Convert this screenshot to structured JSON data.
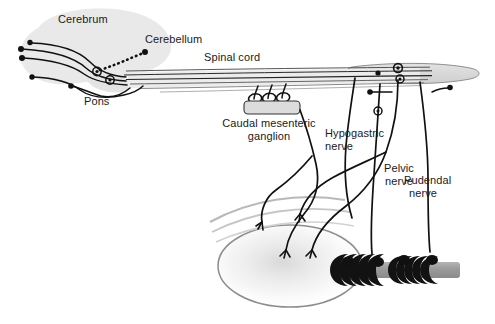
{
  "figure": {
    "background_color": "#ffffff",
    "width": 495,
    "height": 324
  },
  "colors": {
    "brain_fill": "#e8e8e8",
    "spinal_fill": "#d8d8d8",
    "ganglion_fill": "#d9d9d9",
    "nerve_stroke": "#000000",
    "outline_stroke": "#6e6e6e",
    "bladder_stroke": "#8a8a8a",
    "urethra_fill": "#9a9a9a",
    "sphincter_fill": "#111111",
    "text_color": "#1a1a1a"
  },
  "labels": {
    "cerebrum": "Cerebrum",
    "cerebellum": "Cerebellum",
    "pons": "Pons",
    "spinal_cord": "Spinal cord",
    "caudal_mesenteric_ganglion_line1": "Caudal mesenteric",
    "caudal_mesenteric_ganglion_line2": "ganglion",
    "hypogastric_line1": "Hypogastric",
    "hypogastric_line2": "nerve",
    "pelvic_line1": "Pelvic",
    "pelvic_line2": "nerve",
    "pudendal_line1": "Pudendal",
    "pudendal_line2": "nerve"
  },
  "structures": [
    {
      "name": "cerebrum",
      "type": "brain-region",
      "label": "Cerebrum"
    },
    {
      "name": "cerebellum",
      "type": "brain-region",
      "label": "Cerebellum"
    },
    {
      "name": "pons",
      "type": "brainstem-region",
      "label": "Pons"
    },
    {
      "name": "spinal-cord",
      "type": "cord",
      "label": "Spinal cord"
    },
    {
      "name": "caudal-mesenteric-ganglion",
      "type": "ganglion",
      "label": "Caudal mesenteric ganglion"
    },
    {
      "name": "urinary-bladder",
      "type": "organ",
      "label": ""
    },
    {
      "name": "urethra",
      "type": "organ",
      "label": ""
    },
    {
      "name": "urethral-sphincter",
      "type": "muscle",
      "label": ""
    }
  ],
  "nerves": [
    {
      "name": "hypogastric-nerve",
      "label": "Hypogastric nerve",
      "type": "sympathetic"
    },
    {
      "name": "pelvic-nerve",
      "label": "Pelvic nerve",
      "type": "parasympathetic"
    },
    {
      "name": "pudendal-nerve",
      "label": "Pudendal nerve",
      "type": "somatic"
    }
  ],
  "label_positions": {
    "cerebrum": {
      "x": 58,
      "y": 18
    },
    "cerebellum": {
      "x": 145,
      "y": 38
    },
    "pons": {
      "x": 84,
      "y": 96
    },
    "spinal_cord": {
      "x": 204,
      "y": 54
    },
    "ganglion": {
      "x": 226,
      "y": 118
    },
    "hypogastric": {
      "x": 326,
      "y": 128
    },
    "pelvic": {
      "x": 385,
      "y": 163
    },
    "pudendal": {
      "x": 408,
      "y": 175
    }
  }
}
